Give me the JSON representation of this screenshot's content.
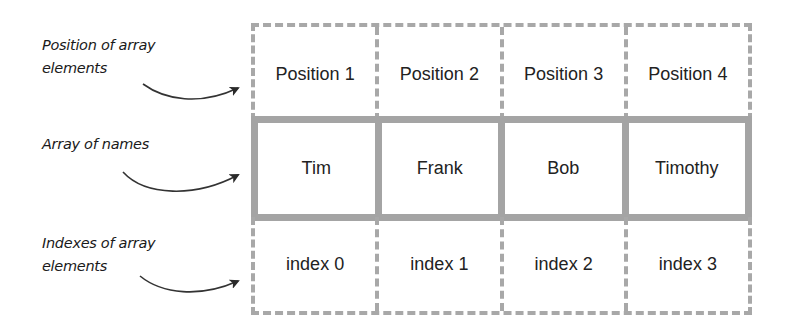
{
  "annotations": {
    "positions": [
      "Position of array",
      "elements"
    ],
    "names": [
      "Array of names"
    ],
    "indexes": [
      "Indexes of array",
      "elements"
    ]
  },
  "rows": {
    "positions": [
      "Position 1",
      "Position 2",
      "Position 3",
      "Position 4"
    ],
    "names": [
      "Tim",
      "Frank",
      "Bob",
      "Timothy"
    ],
    "indexes": [
      "index 0",
      "index 1",
      "index 2",
      "index 3"
    ]
  },
  "colors": {
    "border": "#a4a4a4",
    "dashed_border": "#a8a8a8",
    "text": "#222222",
    "arrow": "#333333"
  },
  "icons": {
    "arrow": "curved-arrow-icon"
  }
}
